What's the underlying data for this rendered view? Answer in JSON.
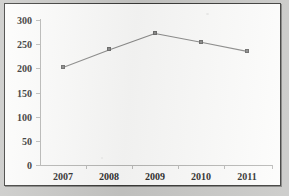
{
  "chart_data": {
    "type": "line",
    "title": "",
    "subtitle": "",
    "xlabel": "",
    "ylabel": "",
    "categories": [
      "2007",
      "2008",
      "2009",
      "2010",
      "2011"
    ],
    "values": [
      202,
      238,
      272,
      254,
      235
    ],
    "series": [
      {
        "name": "",
        "values": [
          202,
          238,
          272,
          254,
          235
        ]
      }
    ],
    "ylim": [
      0,
      300
    ],
    "y_ticks": [
      "0",
      "50",
      "100",
      "150",
      "200",
      "250",
      "300"
    ],
    "y_tick_values": [
      0,
      50,
      100,
      150,
      200,
      250,
      300
    ],
    "x_ticks": [
      "2007",
      "2008",
      "2009",
      "2010",
      "2011"
    ],
    "grid": false,
    "legend": false,
    "legend_position": "none",
    "annotations": [],
    "marker_style": "square",
    "colors": {
      "line": "#8d8d8c",
      "marker": "#8d8d8c",
      "marker_edge": "#6e6e6d",
      "axis": "#b9b9b7",
      "tick_label": "#2f2f2e",
      "plot_background": "#fdfdfc",
      "frame_border": "#3a3a38",
      "page_background": "#c9c9c7"
    }
  }
}
